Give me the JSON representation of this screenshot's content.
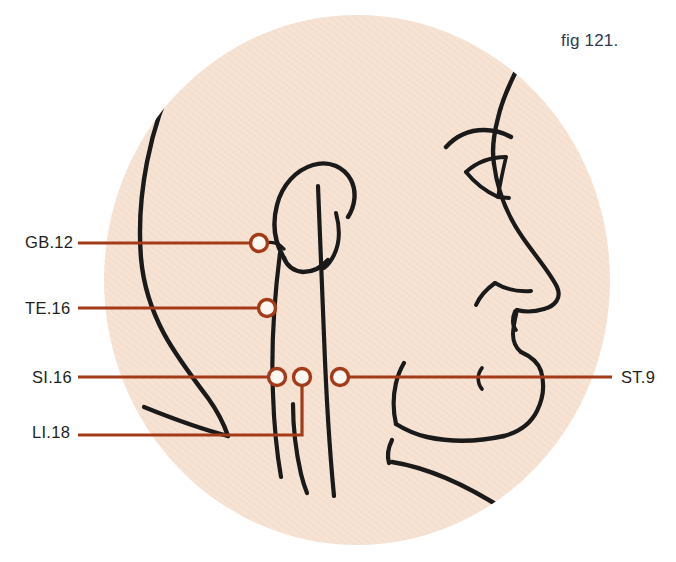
{
  "figure": {
    "caption": "fig 121.",
    "caption_color": "#2e3a52",
    "background_color": "#ffffff",
    "skin_color": "#f6e3d3",
    "outline_color": "#1a1a1a",
    "leader_color": "#a33a18",
    "marker_fill": "#fdf7f1"
  },
  "points": [
    {
      "id": "gb12",
      "label": "GB.12",
      "label_x": 25,
      "label_y": 234,
      "marker_x": 259,
      "marker_y": 243,
      "leader_side": "left"
    },
    {
      "id": "te16",
      "label": "TE.16",
      "label_x": 25,
      "label_y": 300,
      "marker_x": 267,
      "marker_y": 308,
      "leader_side": "left"
    },
    {
      "id": "si16",
      "label": "SI.16",
      "label_x": 32,
      "label_y": 369,
      "marker_x": 277,
      "marker_y": 377,
      "leader_side": "left"
    },
    {
      "id": "li18",
      "label": "LI.18",
      "label_x": 32,
      "label_y": 424,
      "marker_x": 302,
      "marker_y": 377,
      "leader_side": "left-dropped"
    },
    {
      "id": "st9",
      "label": "ST.9",
      "label_x": 621,
      "label_y": 369,
      "marker_x": 340,
      "marker_y": 377,
      "leader_side": "right"
    }
  ],
  "ellipse": {
    "cx": 357,
    "cy": 280,
    "rx": 253,
    "ry": 265
  }
}
